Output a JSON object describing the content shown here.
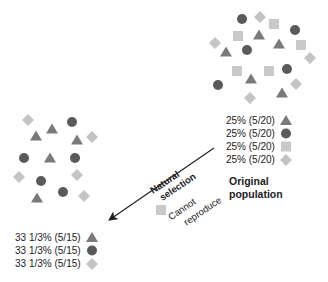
{
  "colors": {
    "triangle": "#7a7a7a",
    "circle": "#5a5a5a",
    "square": "#c9c9c9",
    "diamond": "#c4c4c4",
    "text": "#222222",
    "arrow": "#222222"
  },
  "original_population": {
    "title_line1": "Original",
    "title_line2": "population",
    "legend": [
      {
        "label": "25% (5/20)",
        "shape": "triangle"
      },
      {
        "label": "25% (5/20)",
        "shape": "circle"
      },
      {
        "label": "25% (5/20)",
        "shape": "square"
      },
      {
        "label": "25% (5/20)",
        "shape": "diamond"
      }
    ]
  },
  "selected_population": {
    "legend": [
      {
        "label": "33 1/3% (5/15)",
        "shape": "triangle"
      },
      {
        "label": "33 1/3% (5/15)",
        "shape": "circle"
      },
      {
        "label": "33 1/3% (5/15)",
        "shape": "diamond"
      }
    ]
  },
  "arrow": {
    "label_line1": "Natural",
    "label_line2": "selection",
    "note_line1": "Cannot",
    "note_line2": "reproduce",
    "note_shape": "square"
  }
}
